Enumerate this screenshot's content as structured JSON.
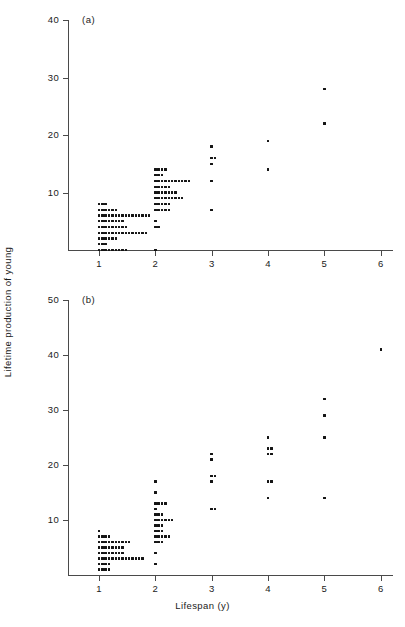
{
  "figure": {
    "axis_labels": {
      "y": "Lifetime production of young",
      "x": "Lifespan (y)"
    },
    "panels": [
      {
        "tag": "(a)",
        "ylim": [
          0,
          40
        ],
        "yticks": [
          0,
          10,
          20,
          30,
          40
        ],
        "ytick_labels": [
          "",
          "10",
          "20",
          "30",
          "40"
        ],
        "xlim": [
          0.45,
          6.2
        ],
        "xticks": [
          1,
          2,
          3,
          4,
          5,
          6
        ],
        "xtick_labels": [
          "1",
          "2",
          "3",
          "4",
          "5",
          "6"
        ]
      },
      {
        "tag": "(b)",
        "ylim": [
          0,
          50
        ],
        "yticks": [
          0,
          10,
          20,
          30,
          40,
          50
        ],
        "ytick_labels": [
          "",
          "10",
          "20",
          "30",
          "40",
          "50"
        ],
        "xlim": [
          0.45,
          6.2
        ],
        "xticks": [
          1,
          2,
          3,
          4,
          5,
          6
        ],
        "xtick_labels": [
          "1",
          "2",
          "3",
          "4",
          "5",
          "6"
        ]
      }
    ]
  },
  "chart_data": [
    {
      "type": "scatter",
      "panel": "(a)",
      "title": "",
      "xlabel": "Lifespan (y)",
      "ylabel": "Lifetime production of young",
      "xlim": [
        0.45,
        6.2
      ],
      "ylim": [
        0,
        40
      ],
      "xticks": [
        1,
        2,
        3,
        4,
        5,
        6
      ],
      "yticks": [
        0,
        10,
        20,
        30,
        40
      ],
      "grid": false,
      "legend": "none",
      "note": "Stacked dot plot: each row is one lifespan value; counts give the number of individuals at that production level.",
      "stacks": [
        {
          "x": 1,
          "y": 8,
          "count": 3
        },
        {
          "x": 1,
          "y": 7,
          "count": 6
        },
        {
          "x": 1,
          "y": 6,
          "count": 16
        },
        {
          "x": 1,
          "y": 5,
          "count": 8
        },
        {
          "x": 1,
          "y": 4,
          "count": 9
        },
        {
          "x": 1,
          "y": 3,
          "count": 15
        },
        {
          "x": 1,
          "y": 2,
          "count": 6
        },
        {
          "x": 1,
          "y": 1,
          "count": 3
        },
        {
          "x": 1,
          "y": 0,
          "count": 9
        },
        {
          "x": 2,
          "y": 14,
          "count": 4
        },
        {
          "x": 2,
          "y": 13,
          "count": 3
        },
        {
          "x": 2,
          "y": 12,
          "count": 11
        },
        {
          "x": 2,
          "y": 11,
          "count": 5
        },
        {
          "x": 2,
          "y": 10,
          "count": 7
        },
        {
          "x": 2,
          "y": 9,
          "count": 9
        },
        {
          "x": 2,
          "y": 8,
          "count": 5
        },
        {
          "x": 2,
          "y": 7,
          "count": 5
        },
        {
          "x": 2,
          "y": 5,
          "count": 1
        },
        {
          "x": 2,
          "y": 4,
          "count": 2
        },
        {
          "x": 2,
          "y": 0,
          "count": 1
        },
        {
          "x": 3,
          "y": 18,
          "count": 1
        },
        {
          "x": 3,
          "y": 16,
          "count": 2
        },
        {
          "x": 3,
          "y": 15,
          "count": 1
        },
        {
          "x": 3,
          "y": 12,
          "count": 1
        },
        {
          "x": 3,
          "y": 7,
          "count": 1
        },
        {
          "x": 4,
          "y": 19,
          "count": 1
        },
        {
          "x": 4,
          "y": 14,
          "count": 1
        },
        {
          "x": 5,
          "y": 28,
          "count": 1
        },
        {
          "x": 5,
          "y": 22,
          "count": 1
        }
      ]
    },
    {
      "type": "scatter",
      "panel": "(b)",
      "title": "",
      "xlabel": "Lifespan (y)",
      "ylabel": "Lifetime production of young",
      "xlim": [
        0.45,
        6.2
      ],
      "ylim": [
        0,
        50
      ],
      "xticks": [
        1,
        2,
        3,
        4,
        5,
        6
      ],
      "yticks": [
        0,
        10,
        20,
        30,
        40,
        50
      ],
      "grid": false,
      "legend": "none",
      "note": "Stacked dot plot: each row is one lifespan value; counts give the number of individuals at that production level.",
      "stacks": [
        {
          "x": 1,
          "y": 8,
          "count": 1
        },
        {
          "x": 1,
          "y": 7,
          "count": 4
        },
        {
          "x": 1,
          "y": 6,
          "count": 10
        },
        {
          "x": 1,
          "y": 5,
          "count": 8
        },
        {
          "x": 1,
          "y": 4,
          "count": 8
        },
        {
          "x": 1,
          "y": 3,
          "count": 14
        },
        {
          "x": 1,
          "y": 2,
          "count": 4
        },
        {
          "x": 1,
          "y": 1,
          "count": 4
        },
        {
          "x": 2,
          "y": 17,
          "count": 1
        },
        {
          "x": 2,
          "y": 15,
          "count": 1
        },
        {
          "x": 2,
          "y": 13,
          "count": 4
        },
        {
          "x": 2,
          "y": 12,
          "count": 1
        },
        {
          "x": 2,
          "y": 11,
          "count": 3
        },
        {
          "x": 2,
          "y": 10,
          "count": 6
        },
        {
          "x": 2,
          "y": 9,
          "count": 3
        },
        {
          "x": 2,
          "y": 8,
          "count": 3
        },
        {
          "x": 2,
          "y": 7,
          "count": 5
        },
        {
          "x": 2,
          "y": 6,
          "count": 3
        },
        {
          "x": 2,
          "y": 4,
          "count": 1
        },
        {
          "x": 2,
          "y": 2,
          "count": 1
        },
        {
          "x": 3,
          "y": 22,
          "count": 1
        },
        {
          "x": 3,
          "y": 21,
          "count": 1
        },
        {
          "x": 3,
          "y": 18,
          "count": 2
        },
        {
          "x": 3,
          "y": 17,
          "count": 1
        },
        {
          "x": 3,
          "y": 12,
          "count": 2
        },
        {
          "x": 4,
          "y": 25,
          "count": 1
        },
        {
          "x": 4,
          "y": 23,
          "count": 2
        },
        {
          "x": 4,
          "y": 22,
          "count": 2
        },
        {
          "x": 4,
          "y": 17,
          "count": 2
        },
        {
          "x": 4,
          "y": 14,
          "count": 1
        },
        {
          "x": 5,
          "y": 32,
          "count": 1
        },
        {
          "x": 5,
          "y": 29,
          "count": 1
        },
        {
          "x": 5,
          "y": 25,
          "count": 1
        },
        {
          "x": 5,
          "y": 14,
          "count": 1
        },
        {
          "x": 6,
          "y": 41,
          "count": 1
        }
      ]
    }
  ]
}
